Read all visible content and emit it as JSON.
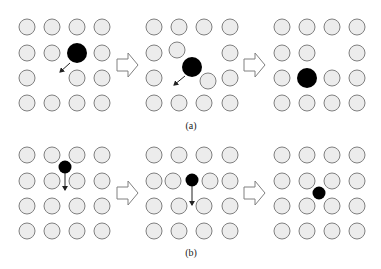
{
  "diagram": {
    "colors": {
      "atom_fill": "#ececec",
      "atom_stroke": "#808080",
      "defect": "#000000"
    },
    "panels": [
      {
        "caption": "(a)",
        "description": "Large interstitial defect displacing lattice atoms",
        "frames": [
          {
            "atoms": [
              [
                27,
                27
              ],
              [
                52,
                27
              ],
              [
                77,
                27
              ],
              [
                102,
                27
              ],
              [
                27,
                53
              ],
              [
                52,
                53
              ],
              [
                102,
                53
              ],
              [
                27,
                78
              ],
              [
                77,
                78
              ],
              [
                102,
                78
              ],
              [
                27,
                103
              ],
              [
                52,
                103
              ],
              [
                77,
                103
              ],
              [
                102,
                103
              ]
            ],
            "defect": {
              "x": 77,
              "y": 53,
              "r": 10
            },
            "arrow": {
              "x1": 70,
              "y1": 63,
              "x2": 60,
              "y2": 72
            }
          },
          {
            "atoms": [
              [
                154,
                27
              ],
              [
                179,
                27
              ],
              [
                204,
                27
              ],
              [
                230,
                27
              ],
              [
                154,
                53
              ],
              [
                177,
                50
              ],
              [
                230,
                53
              ],
              [
                154,
                78
              ],
              [
                208,
                81
              ],
              [
                230,
                78
              ],
              [
                154,
                103
              ],
              [
                179,
                103
              ],
              [
                204,
                103
              ],
              [
                230,
                103
              ]
            ],
            "defect": {
              "x": 192,
              "y": 67,
              "r": 10
            },
            "arrow": {
              "x1": 185,
              "y1": 76,
              "x2": 174,
              "y2": 85
            }
          },
          {
            "atoms": [
              [
                282,
                27
              ],
              [
                307,
                27
              ],
              [
                332,
                27
              ],
              [
                357,
                27
              ],
              [
                282,
                53
              ],
              [
                307,
                53
              ],
              [
                357,
                53
              ],
              [
                282,
                78
              ],
              [
                332,
                78
              ],
              [
                357,
                78
              ],
              [
                282,
                103
              ],
              [
                307,
                103
              ],
              [
                332,
                103
              ],
              [
                357,
                103
              ]
            ],
            "defect": {
              "x": 307,
              "y": 78,
              "r": 10
            },
            "arrow": null
          }
        ]
      },
      {
        "caption": "(b)",
        "description": "Small interstitial defect diffusing between lattice sites",
        "frames": [
          {
            "atoms": [
              [
                27,
                155
              ],
              [
                52,
                155
              ],
              [
                77,
                155
              ],
              [
                102,
                155
              ],
              [
                27,
                181
              ],
              [
                52,
                181
              ],
              [
                77,
                181
              ],
              [
                102,
                181
              ],
              [
                27,
                206
              ],
              [
                52,
                206
              ],
              [
                77,
                206
              ],
              [
                102,
                206
              ],
              [
                27,
                231
              ],
              [
                52,
                231
              ],
              [
                77,
                231
              ],
              [
                102,
                231
              ]
            ],
            "defect": {
              "x": 65,
              "y": 167,
              "r": 6.5
            },
            "arrow": {
              "x1": 65,
              "y1": 173,
              "x2": 65,
              "y2": 190
            }
          },
          {
            "atoms": [
              [
                154,
                155
              ],
              [
                179,
                155
              ],
              [
                204,
                155
              ],
              [
                230,
                155
              ],
              [
                154,
                181
              ],
              [
                173,
                181
              ],
              [
                210,
                181
              ],
              [
                230,
                181
              ],
              [
                154,
                206
              ],
              [
                179,
                206
              ],
              [
                204,
                206
              ],
              [
                230,
                206
              ],
              [
                154,
                231
              ],
              [
                179,
                231
              ],
              [
                204,
                231
              ],
              [
                230,
                231
              ]
            ],
            "defect": {
              "x": 192,
              "y": 180,
              "r": 6.5
            },
            "arrow": {
              "x1": 192,
              "y1": 186,
              "x2": 192,
              "y2": 205
            }
          },
          {
            "atoms": [
              [
                282,
                155
              ],
              [
                307,
                155
              ],
              [
                332,
                155
              ],
              [
                357,
                155
              ],
              [
                282,
                181
              ],
              [
                307,
                181
              ],
              [
                332,
                181
              ],
              [
                357,
                181
              ],
              [
                282,
                206
              ],
              [
                307,
                206
              ],
              [
                332,
                206
              ],
              [
                357,
                206
              ],
              [
                282,
                231
              ],
              [
                307,
                231
              ],
              [
                332,
                231
              ],
              [
                357,
                231
              ]
            ],
            "defect": {
              "x": 319,
              "y": 193,
              "r": 6.5
            },
            "arrow": null
          }
        ]
      }
    ],
    "step_arrows": [
      {
        "x": 117,
        "y": 65
      },
      {
        "x": 244,
        "y": 65
      },
      {
        "x": 117,
        "y": 193
      },
      {
        "x": 244,
        "y": 193
      }
    ]
  }
}
